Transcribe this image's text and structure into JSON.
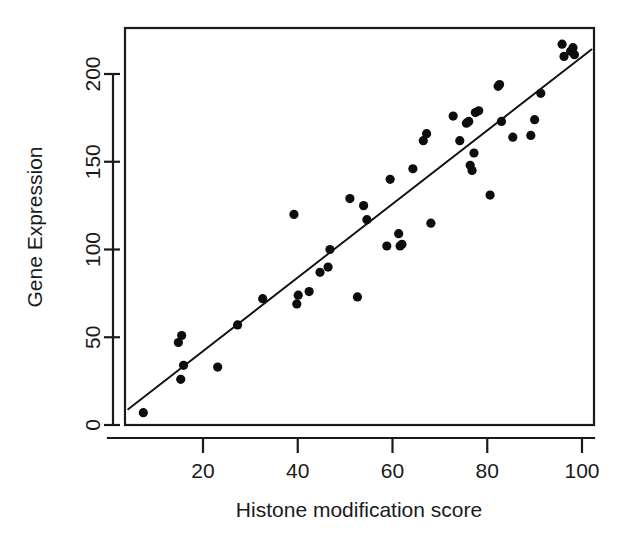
{
  "chart_data": {
    "type": "scatter",
    "title": "",
    "xlabel": "Histone modification score",
    "ylabel": "Gene Expression",
    "xlim": [
      3.5,
      102.5
    ],
    "ylim": [
      0,
      222
    ],
    "grid": false,
    "legend": null,
    "xticks": [
      20,
      40,
      60,
      80,
      100
    ],
    "xtick_labels": [
      "20",
      "40",
      "60",
      "80",
      "100"
    ],
    "yticks": [
      0,
      50,
      100,
      150,
      200
    ],
    "ytick_labels": [
      "0",
      "50",
      "100",
      "150",
      "200"
    ],
    "x": [
      7.4,
      14.8,
      15.5,
      15.9,
      15.3,
      23.1,
      27.3,
      32.6,
      39.2,
      39.8,
      40.1,
      42.4,
      44.7,
      46.4,
      46.8,
      51.0,
      52.6,
      53.9,
      54.6,
      58.8,
      59.5,
      61.3,
      61.6,
      62.0,
      64.3,
      66.5,
      67.2,
      68.1,
      72.8,
      74.2,
      75.6,
      76.1,
      76.4,
      76.8,
      77.2,
      77.5,
      78.2,
      80.6,
      82.3,
      82.6,
      83.0,
      85.4,
      89.2,
      90.0,
      91.3,
      95.8,
      96.2,
      97.6,
      98.1,
      98.4
    ],
    "y": [
      7,
      47,
      51,
      34,
      26,
      33,
      57,
      72,
      120,
      69,
      74,
      76,
      87,
      90,
      100,
      129,
      73,
      125,
      117,
      102,
      140,
      109,
      102,
      103,
      146,
      162,
      166,
      115,
      176,
      162,
      172,
      173,
      148,
      145,
      155,
      178,
      179,
      131,
      193,
      194,
      173,
      164,
      165,
      174,
      189,
      217,
      210,
      213,
      215,
      211
    ],
    "fit_line": {
      "type": "linear-regression",
      "x_start": 4.2,
      "y_start": 9,
      "x_end": 102.0,
      "y_end": 214
    }
  },
  "axis": {
    "y_title": "Gene Expression",
    "x_title": "Histone modification score"
  }
}
